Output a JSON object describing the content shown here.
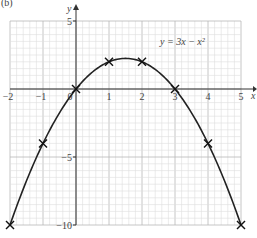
{
  "figure_label": "(b)",
  "chart_data": {
    "type": "line",
    "title": "",
    "equation_label": "y = 3x − x²",
    "xlabel": "x",
    "ylabel": "y",
    "xlim": [
      -2,
      5
    ],
    "ylim": [
      -10,
      5
    ],
    "grid": true,
    "x_ticks": [
      -2,
      -1,
      1,
      2,
      3,
      4,
      5
    ],
    "y_ticks": [
      5,
      -5,
      -10
    ],
    "origin_label": "0",
    "series": [
      {
        "name": "y = 3x − x²",
        "function": "3x - x^2",
        "marked_points": [
          {
            "x": -2,
            "y": -10
          },
          {
            "x": -1,
            "y": -4
          },
          {
            "x": 0,
            "y": 0
          },
          {
            "x": 1,
            "y": 2
          },
          {
            "x": 2,
            "y": 2
          },
          {
            "x": 3,
            "y": 0
          },
          {
            "x": 4,
            "y": -4
          },
          {
            "x": 5,
            "y": -10
          }
        ]
      }
    ]
  },
  "colors": {
    "grid": "#cfcfcf",
    "axis": "#333333",
    "curve": "#222222"
  }
}
